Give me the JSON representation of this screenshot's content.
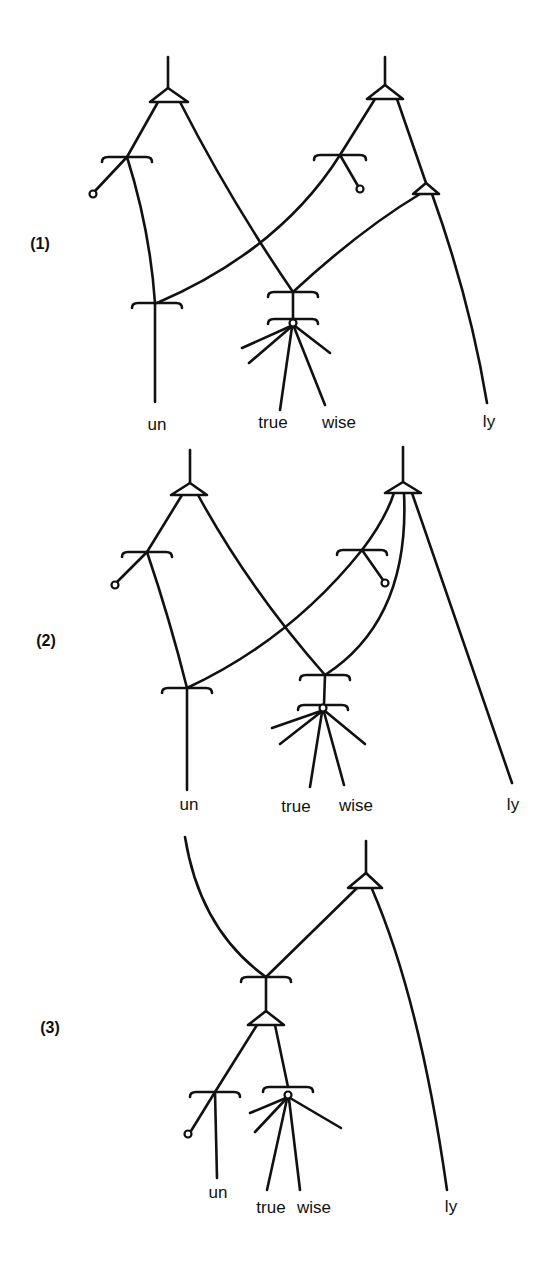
{
  "figure": {
    "stroke_color": "#111111",
    "background": "#ffffff",
    "diagrams": [
      {
        "id": "1",
        "number_label": {
          "text": "(1)",
          "x": 40,
          "y": 249
        },
        "words": [
          {
            "text": "un",
            "x": 157,
            "y": 430
          },
          {
            "text": "true",
            "x": 273,
            "y": 428
          },
          {
            "text": "wise",
            "x": 339,
            "y": 428
          },
          {
            "text": "ly",
            "x": 489,
            "y": 427
          }
        ],
        "triangles": [
          {
            "apex": [
              168,
              88
            ],
            "left": [
              150,
              102
            ],
            "right": [
              188,
              102
            ]
          },
          {
            "apex": [
              385,
              85
            ],
            "left": [
              367,
              99
            ],
            "right": [
              403,
              99
            ]
          },
          {
            "apex": [
              426,
              183
            ],
            "left": [
              413,
              194
            ],
            "right": [
              439,
              194
            ]
          }
        ],
        "brackets": [
          {
            "cx": 127,
            "cy": 157,
            "hw": 25
          },
          {
            "cx": 340,
            "cy": 155,
            "hw": 26
          },
          {
            "cx": 157,
            "cy": 303,
            "hw": 25
          },
          {
            "cx": 293,
            "cy": 292,
            "hw": 25
          },
          {
            "cx": 293,
            "cy": 319,
            "hw": 25
          }
        ],
        "circles": [
          {
            "cx": 93,
            "cy": 194,
            "r": 3.5
          },
          {
            "cx": 360,
            "cy": 189,
            "r": 3.5
          },
          {
            "cx": 293,
            "cy": 323,
            "r": 3.5
          }
        ],
        "paths": [
          "M168 57 L168 88",
          "M385 57 L385 85",
          "M158 102 L127 157 L95 191",
          "M127 157 Q150 230 155 303 L155 402",
          "M180 102 Q230 200 293 292",
          "M375 99 L340 155 L358 186",
          "M340 155 Q280 250 157 303",
          "M397 99 L426 183",
          "M420 194 Q360 230 293 292",
          "M432 194 Q470 300 487 403",
          "M293 292 L293 320",
          "M291 326 L242 348",
          "M291 327 L249 363",
          "M295 326 L330 353",
          "M292 327 L280 410",
          "M294 327 L325 405"
        ]
      },
      {
        "id": "2",
        "number_label": {
          "text": "(2)",
          "x": 46,
          "y": 646
        },
        "words": [
          {
            "text": "un",
            "x": 189,
            "y": 810
          },
          {
            "text": "true",
            "x": 296,
            "y": 812
          },
          {
            "text": "wise",
            "x": 356,
            "y": 811
          },
          {
            "text": "ly",
            "x": 513,
            "y": 810
          }
        ],
        "triangles": [
          {
            "apex": [
              190,
              483
            ],
            "left": [
              171,
              495
            ],
            "right": [
              207,
              495
            ]
          },
          {
            "apex": [
              403,
              482
            ],
            "left": [
              385,
              493
            ],
            "right": [
              421,
              493
            ]
          }
        ],
        "brackets": [
          {
            "cx": 147,
            "cy": 552,
            "hw": 25
          },
          {
            "cx": 362,
            "cy": 550,
            "hw": 25
          },
          {
            "cx": 187,
            "cy": 688,
            "hw": 25
          },
          {
            "cx": 325,
            "cy": 675,
            "hw": 25
          },
          {
            "cx": 323,
            "cy": 705,
            "hw": 25
          }
        ],
        "circles": [
          {
            "cx": 115,
            "cy": 585,
            "r": 3.5
          },
          {
            "cx": 385,
            "cy": 583,
            "r": 3.5
          },
          {
            "cx": 323,
            "cy": 708,
            "r": 3.5
          }
        ],
        "paths": [
          "M190 450 L190 483",
          "M403 447 L403 482",
          "M182 495 L147 552 L117 582",
          "M147 552 Q170 620 187 688 L187 790",
          "M198 495 Q250 590 325 675",
          "M394 493 Q385 520 362 550 L383 580",
          "M362 550 Q290 640 187 688",
          "M404 493 Q410 620 325 675",
          "M412 493 L512 783",
          "M325 675 L324 705",
          "M321 711 L272 728",
          "M321 712 L280 744",
          "M325 711 L365 744",
          "M322 712 L310 787",
          "M324 712 L344 785"
        ]
      },
      {
        "id": "3",
        "number_label": {
          "text": "(3)",
          "x": 50,
          "y": 1033
        },
        "words": [
          {
            "text": "un",
            "x": 218,
            "y": 1198
          },
          {
            "text": "true",
            "x": 271,
            "y": 1213
          },
          {
            "text": "wise",
            "x": 314,
            "y": 1213
          },
          {
            "text": "ly",
            "x": 451,
            "y": 1212
          }
        ],
        "triangles": [
          {
            "apex": [
              366,
              873
            ],
            "left": [
              348,
              888
            ],
            "right": [
              382,
              888
            ]
          },
          {
            "apex": [
              266,
              1011
            ],
            "left": [
              248,
              1025
            ],
            "right": [
              284,
              1025
            ]
          }
        ],
        "brackets": [
          {
            "cx": 266,
            "cy": 977,
            "hw": 25
          },
          {
            "cx": 215,
            "cy": 1092,
            "hw": 25
          },
          {
            "cx": 288,
            "cy": 1087,
            "hw": 25
          }
        ],
        "circles": [
          {
            "cx": 188,
            "cy": 1134,
            "r": 3.5
          },
          {
            "cx": 288,
            "cy": 1095,
            "r": 3.5
          }
        ],
        "paths": [
          "M366 841 L366 873",
          "M185 837 Q200 930 266 977",
          "M357 888 L266 977",
          "M266 977 L266 1011",
          "M257 1025 L215 1092 L191 1131",
          "M215 1092 L217 1178",
          "M275 1025 L288 1087",
          "M286 1098 L250 1113",
          "M286 1099 L255 1132",
          "M290 1098 L341 1128",
          "M287 1099 L267 1190",
          "M289 1099 L300 1190",
          "M372 889 Q420 1000 447 1190"
        ]
      }
    ]
  }
}
